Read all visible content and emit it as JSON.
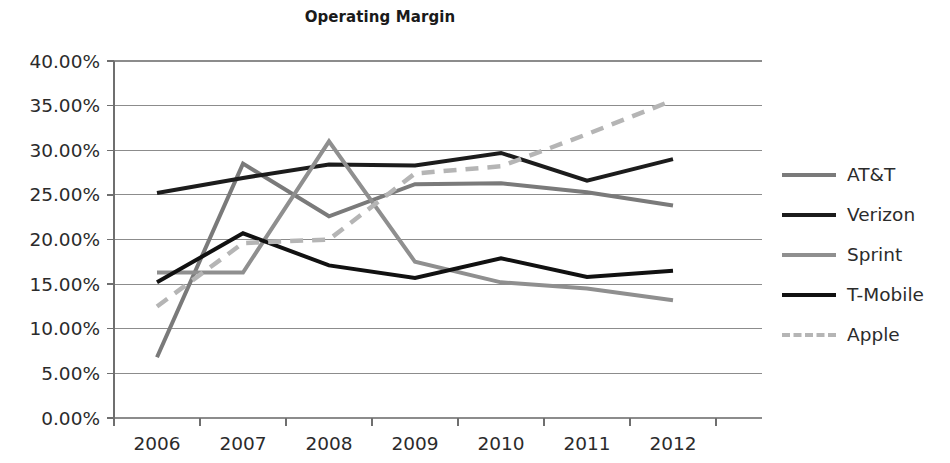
{
  "chart_data": {
    "type": "line",
    "title": "Operating Margin",
    "xlabel": "",
    "ylabel": "",
    "categories": [
      "2006",
      "2007",
      "2008",
      "2009",
      "2010",
      "2011",
      "2012"
    ],
    "x": [
      2006,
      2007,
      2008,
      2009,
      2010,
      2011,
      2012
    ],
    "ylim": [
      0,
      40
    ],
    "ytick_values": [
      0,
      5,
      10,
      15,
      20,
      25,
      30,
      35,
      40
    ],
    "ytick_labels": [
      "0.00%",
      "5.00%",
      "10.00%",
      "15.00%",
      "20.00%",
      "25.00%",
      "30.00%",
      "35.00%",
      "40.00%"
    ],
    "grid": true,
    "grid_axis": "y",
    "legend_position": "right",
    "value_unit": "percent",
    "series": [
      {
        "name": "AT&T",
        "values": [
          6.8,
          28.5,
          22.6,
          26.2,
          26.3,
          25.3,
          23.8
        ],
        "color": "#7a7a7a",
        "style": "solid",
        "width": 4
      },
      {
        "name": "Verizon",
        "values": [
          25.2,
          26.9,
          28.4,
          28.3,
          29.7,
          26.6,
          29.0
        ],
        "color": "#1c1c1c",
        "style": "solid",
        "width": 4
      },
      {
        "name": "Sprint",
        "values": [
          16.3,
          16.3,
          31.0,
          17.5,
          15.2,
          14.5,
          13.2
        ],
        "color": "#8f8f8f",
        "style": "solid",
        "width": 4
      },
      {
        "name": "T-Mobile",
        "values": [
          15.2,
          20.7,
          17.1,
          15.7,
          17.9,
          15.8,
          16.5
        ],
        "color": "#111111",
        "style": "solid",
        "width": 4
      },
      {
        "name": "Apple",
        "values": [
          12.5,
          19.6,
          20.0,
          27.4,
          28.2,
          31.8,
          35.6
        ],
        "color": "#b5b5b5",
        "style": "dashed",
        "width": 4.5
      }
    ]
  },
  "legend": {
    "items": [
      {
        "label": "AT&T"
      },
      {
        "label": "Verizon"
      },
      {
        "label": "Sprint"
      },
      {
        "label": "T-Mobile"
      },
      {
        "label": "Apple"
      }
    ]
  },
  "axes": {
    "y_labels": [
      "40.00%",
      "35.00%",
      "30.00%",
      "25.00%",
      "20.00%",
      "15.00%",
      "10.00%",
      "5.00%",
      "0.00%"
    ],
    "x_labels": [
      "2006",
      "2007",
      "2008",
      "2009",
      "2010",
      "2011",
      "2012"
    ]
  }
}
